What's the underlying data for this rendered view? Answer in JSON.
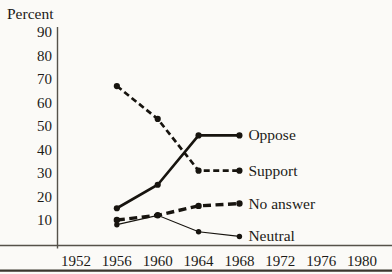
{
  "chart_data": {
    "type": "line",
    "title": "",
    "ylabel": "Percent",
    "xlabel": "",
    "x": [
      1956,
      1960,
      1964,
      1968
    ],
    "x_axis_ticks": [
      1952,
      1956,
      1960,
      1964,
      1968,
      1972,
      1976,
      1980
    ],
    "y_ticks": [
      90,
      80,
      70,
      60,
      50,
      40,
      30,
      20,
      10
    ],
    "ylim": [
      0,
      95
    ],
    "xlim": [
      1946,
      1983
    ],
    "grid": false,
    "legend_position": "labels-at-line-ends",
    "series": [
      {
        "name": "Support",
        "style": "dashed",
        "values": [
          67,
          53,
          31,
          31
        ]
      },
      {
        "name": "Oppose",
        "style": "solid-thick",
        "values": [
          15,
          25,
          46,
          46
        ]
      },
      {
        "name": "No answer",
        "style": "dashed-heavy",
        "values": [
          10,
          12,
          16,
          17
        ]
      },
      {
        "name": "Neutral",
        "style": "solid-thin",
        "values": [
          8,
          12,
          5,
          3
        ]
      }
    ],
    "colors": {
      "line": "#17140f",
      "text": "#1c1a17",
      "axis": "#56524a",
      "bottom_rule": "#3a362e",
      "background": "#fbfaf7"
    }
  }
}
